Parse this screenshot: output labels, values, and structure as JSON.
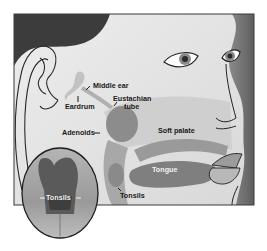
{
  "diagram": {
    "labels": {
      "middle_ear": "Middle ear",
      "eardrum": "Eardrum",
      "eustachian_line1": "Eustachian",
      "eustachian_line2": "tube",
      "adenoids": "Adenoids",
      "soft_palate": "Soft palate",
      "tongue": "Tongue",
      "tonsils": "Tonsils",
      "inset_tonsils": "Tonsils"
    },
    "colors": {
      "background": "#ffffff",
      "frame_border": "#3a3a3a",
      "hair": "#3c3c3c",
      "skin": "#e6e6e6",
      "shadow_side": "#6e6e6e",
      "airway": "#c9c9c9",
      "tissue": "#8c8c8c",
      "inset_fill": "#9a9a9a",
      "inset_throat": "#4a4a4a"
    }
  }
}
